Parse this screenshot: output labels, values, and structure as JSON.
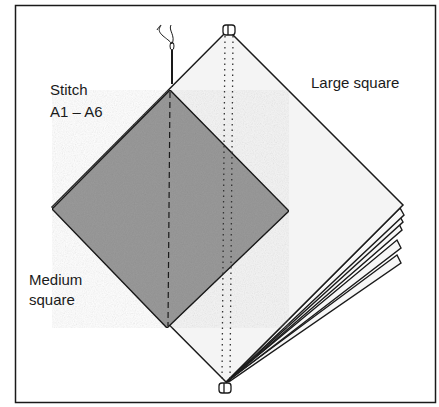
{
  "diagram": {
    "labels": {
      "stitch_line1": "Stitch",
      "stitch_line2": "A1 – A6",
      "large": "Large square",
      "medium_line1": "Medium",
      "medium_line2": "square"
    },
    "colors": {
      "outline": "#1a1a1a",
      "large_fill": "#f4f4f4",
      "medium_fill": "#9a9a9a",
      "background": "#ffffff"
    },
    "stacked_sheet_count": 6,
    "icons": [
      "needle-icon",
      "thread-icon",
      "binding-ring-icon"
    ]
  }
}
